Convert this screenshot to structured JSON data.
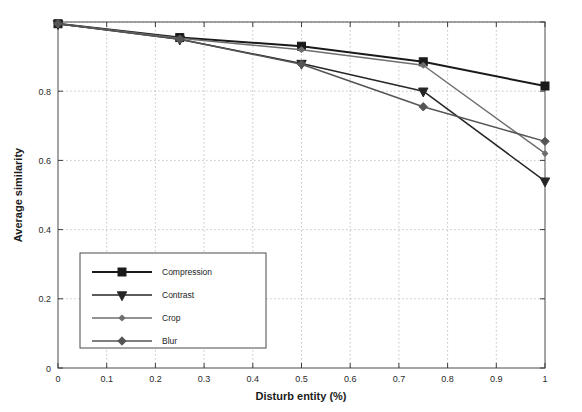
{
  "chart_data": {
    "type": "line",
    "title": "",
    "xlabel": "Disturb entity (%)",
    "ylabel": "Average similarity",
    "xlim": [
      0,
      1
    ],
    "ylim": [
      0,
      1
    ],
    "xticks": [
      0,
      0.1,
      0.2,
      0.3,
      0.4,
      0.5,
      0.6,
      0.7,
      0.8,
      0.9,
      1
    ],
    "xtick_labels": [
      "0",
      "0.1",
      "0.2",
      "0.3",
      "0.4",
      "0.5",
      "0.6",
      "0.7",
      "0.8",
      "0.9",
      "1"
    ],
    "yticks": [
      0,
      0.2,
      0.4,
      0.6,
      0.8,
      1
    ],
    "ytick_labels": [
      "0",
      "0.2",
      "0.4",
      "0.6",
      "0.8",
      ""
    ],
    "grid": true,
    "legend_position": "lower-left-inside",
    "x": [
      0,
      0.25,
      0.5,
      0.75,
      1
    ],
    "series": [
      {
        "name": "Compression",
        "marker": "square",
        "color": "#1a1a1a",
        "line_width": 2.0,
        "values": [
          0.995,
          0.955,
          0.93,
          0.885,
          0.815
        ]
      },
      {
        "name": "Contrast",
        "marker": "triangle-down",
        "color": "#262626",
        "line_width": 1.5,
        "values": [
          0.995,
          0.95,
          0.88,
          0.8,
          0.54
        ]
      },
      {
        "name": "Crop",
        "marker": "star",
        "color": "#6e6e6e",
        "line_width": 1.5,
        "values": [
          0.995,
          0.953,
          0.92,
          0.875,
          0.62
        ]
      },
      {
        "name": "Blur",
        "marker": "diamond",
        "color": "#555555",
        "line_width": 1.5,
        "values": [
          0.995,
          0.95,
          0.878,
          0.755,
          0.655
        ]
      }
    ]
  },
  "axes": {
    "x_label": "Disturb entity (%)",
    "y_label": "Average similarity"
  },
  "legend": {
    "items": [
      {
        "label": "Compression"
      },
      {
        "label": "Contrast"
      },
      {
        "label": "Crop"
      },
      {
        "label": "Blur"
      }
    ]
  }
}
